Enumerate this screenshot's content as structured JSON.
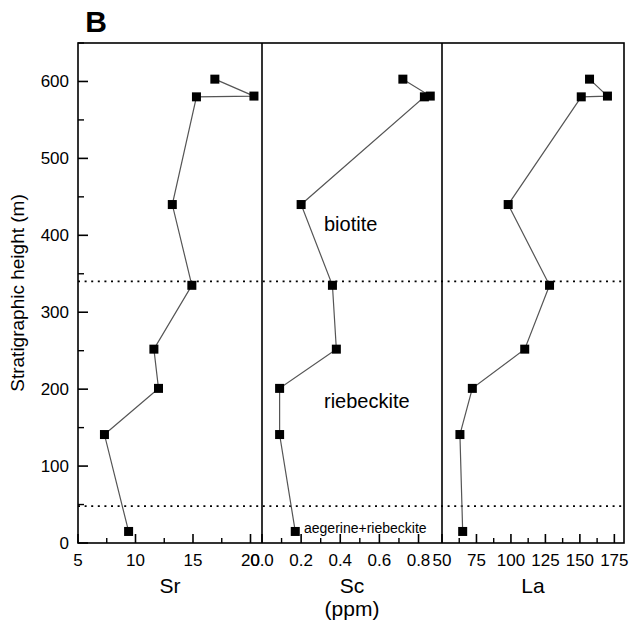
{
  "figure": {
    "panel_letter": "B",
    "ylabel": "Stratigraphic height (m)",
    "units_label": "(ppm)",
    "background": "#ffffff",
    "ink": "#000000",
    "marker_color": "#000000",
    "line_color": "#555555"
  },
  "yaxis": {
    "label": "Stratigraphic height (m)",
    "min": 0,
    "max": 650,
    "major_ticks": [
      0,
      100,
      200,
      300,
      400,
      500,
      600
    ],
    "major_tick_labels": [
      "0",
      "100",
      "200",
      "300",
      "400",
      "500",
      "600"
    ],
    "minor_ticks": [
      50,
      150,
      250,
      350,
      450,
      550,
      650
    ]
  },
  "boundaries": [
    {
      "name": "upper-facies-boundary",
      "height": 340,
      "style": "dotted"
    },
    {
      "name": "lower-facies-boundary",
      "height": 48,
      "style": "dotted"
    }
  ],
  "annotations": [
    {
      "name": "biotite",
      "text": "biotite",
      "height": 415,
      "panel": "Sc"
    },
    {
      "name": "riebeckite",
      "text": "riebeckite",
      "height": 185,
      "panel": "Sc"
    },
    {
      "name": "aegerine-riebeckite",
      "text": "aegerine+riebeckite",
      "height": 22,
      "panel": "Sc"
    }
  ],
  "chart_data": [
    {
      "type": "scatter",
      "name": "Sr",
      "title": "Sr",
      "xlabel": "Sr",
      "ylabel": "Stratigraphic height (m)",
      "xlim": [
        5,
        21
      ],
      "ylim": [
        0,
        650
      ],
      "xticks": [
        5,
        10,
        15,
        20
      ],
      "xtick_labels": [
        "5",
        "10",
        "15",
        "20"
      ],
      "x_minor_ticks": [
        7.5,
        12.5,
        17.5
      ],
      "grid": false,
      "legend": "none",
      "marker": "filled-square",
      "x": [
        9.4,
        7.3,
        12.0,
        11.6,
        14.9,
        13.2,
        15.3,
        16.9,
        20.3
      ],
      "y": [
        15,
        141,
        201,
        252,
        335,
        440,
        580,
        603,
        581
      ],
      "values": [
        {
          "Sr": 9.4,
          "height": 15
        },
        {
          "Sr": 7.3,
          "height": 141
        },
        {
          "Sr": 12.0,
          "height": 201
        },
        {
          "Sr": 11.6,
          "height": 252
        },
        {
          "Sr": 14.9,
          "height": 335
        },
        {
          "Sr": 13.2,
          "height": 440
        },
        {
          "Sr": 15.3,
          "height": 580
        },
        {
          "Sr": 16.9,
          "height": 603
        },
        {
          "Sr": 20.3,
          "height": 581
        }
      ]
    },
    {
      "type": "scatter",
      "name": "Sc",
      "title": "Sc",
      "subtitle": "(ppm)",
      "xlabel": "Sc",
      "ylabel": "Stratigraphic height (m)",
      "xlim": [
        0.0,
        0.92
      ],
      "ylim": [
        0,
        650
      ],
      "xticks": [
        0.0,
        0.2,
        0.4,
        0.6,
        0.8
      ],
      "xtick_labels": [
        "0.0",
        "0.2",
        "0.4",
        "0.6",
        "0.8"
      ],
      "x_minor_ticks": [
        0.1,
        0.3,
        0.5,
        0.7
      ],
      "grid": false,
      "legend": "none",
      "marker": "filled-square",
      "x": [
        0.17,
        0.09,
        0.09,
        0.38,
        0.36,
        0.2,
        0.83,
        0.72,
        0.86
      ],
      "y": [
        15,
        141,
        201,
        252,
        335,
        440,
        580,
        603,
        581
      ],
      "values": [
        {
          "Sc": 0.17,
          "height": 15
        },
        {
          "Sc": 0.09,
          "height": 141
        },
        {
          "Sc": 0.09,
          "height": 201
        },
        {
          "Sc": 0.38,
          "height": 252
        },
        {
          "Sc": 0.36,
          "height": 335
        },
        {
          "Sc": 0.2,
          "height": 440
        },
        {
          "Sc": 0.83,
          "height": 580
        },
        {
          "Sc": 0.72,
          "height": 603
        },
        {
          "Sc": 0.86,
          "height": 581
        }
      ]
    },
    {
      "type": "scatter",
      "name": "La",
      "title": "La",
      "xlabel": "La",
      "ylabel": "Stratigraphic height (m)",
      "xlim": [
        50,
        182
      ],
      "ylim": [
        0,
        650
      ],
      "xticks": [
        50,
        75,
        100,
        125,
        150,
        175
      ],
      "xtick_labels": [
        "50",
        "75",
        "100",
        "125",
        "150",
        "175"
      ],
      "x_minor_ticks": [
        62.5,
        87.5,
        112.5,
        137.5,
        162.5
      ],
      "grid": false,
      "legend": "none",
      "marker": "filled-square",
      "x": [
        65,
        63,
        72,
        110,
        128,
        98,
        151,
        157,
        170
      ],
      "y": [
        15,
        141,
        201,
        252,
        335,
        440,
        580,
        603,
        581
      ],
      "values": [
        {
          "La": 65,
          "height": 15
        },
        {
          "La": 63,
          "height": 141
        },
        {
          "La": 72,
          "height": 201
        },
        {
          "La": 110,
          "height": 252
        },
        {
          "La": 128,
          "height": 335
        },
        {
          "La": 98,
          "height": 440
        },
        {
          "La": 151,
          "height": 580
        },
        {
          "La": 157,
          "height": 603
        },
        {
          "La": 170,
          "height": 581
        }
      ]
    }
  ]
}
